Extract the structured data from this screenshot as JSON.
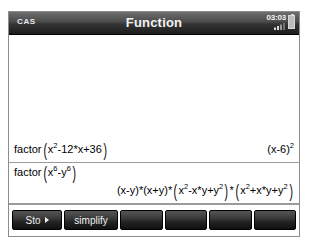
{
  "window": {
    "mode_badge": "CAS",
    "title": "Function",
    "clock": "03:03",
    "signal_icon": "signal-bars-icon",
    "battery_icon": "battery-icon"
  },
  "history": [
    {
      "input_label": "factor(",
      "input_fn": "factor",
      "input_body_1": "x",
      "input_exp_1": "2",
      "input_body_2": "-12*x+36",
      "input_plain": "factor(x^2-12*x+36)",
      "output_base": "(x-6)",
      "output_exp": "2",
      "output_plain": "(x-6)^2"
    },
    {
      "input_fn": "factor",
      "input_body_1": "x",
      "input_exp_1": "6",
      "input_body_2": "-y",
      "input_exp_2": "6",
      "input_plain": "factor(x^6-y^6)",
      "output_f1": "(x-y)",
      "output_op1": "*",
      "output_f2": "(x+y)",
      "output_op2": "*",
      "output_f3_a": "x",
      "output_f3_exp": "2",
      "output_f3_b": "-x*y+y",
      "output_f3_exp2": "2",
      "output_op3": "*",
      "output_f4_a": "x",
      "output_f4_exp": "2",
      "output_f4_b": "+x*y+y",
      "output_f4_exp2": "2",
      "output_plain": "(x-y)*(x+y)*(x^2-x*y+y^2)*(x^2+x*y+y^2)"
    }
  ],
  "softkeys": [
    {
      "label": "Sto",
      "has_arrow": true
    },
    {
      "label": "simplify",
      "has_arrow": false
    },
    {
      "label": "",
      "has_arrow": false
    },
    {
      "label": "",
      "has_arrow": false
    },
    {
      "label": "",
      "has_arrow": false
    },
    {
      "label": "",
      "has_arrow": false
    }
  ],
  "colors": {
    "title_bar_dark": "#1d1d1d",
    "title_bar_light": "#6e6e6e",
    "screen_bg": "#ffffff",
    "separator": "#9b9b9b",
    "key_dark": "#101010",
    "text": "#000000"
  }
}
